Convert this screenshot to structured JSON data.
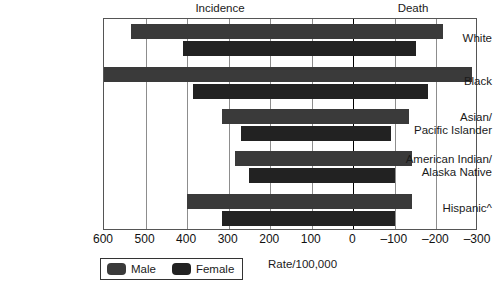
{
  "header": {
    "incidence_label": "Incidence",
    "death_label": "Death"
  },
  "axis": {
    "title": "Rate/100,000",
    "ticks": [
      "600",
      "500",
      "400",
      "300",
      "200",
      "100",
      "0",
      "–100",
      "–200",
      "–300"
    ],
    "tick_values": [
      600,
      500,
      400,
      300,
      200,
      100,
      0,
      -100,
      -200,
      -300
    ]
  },
  "legend": {
    "male_label": "Male",
    "female_label": "Female",
    "male_color": "#3a3a3a",
    "female_color": "#222222"
  },
  "categories": [
    "White",
    "Black",
    "Asian/\nPacific Islander",
    "American Indian/\nAlaska Native",
    "Hispanic^"
  ],
  "chart_data": {
    "type": "bar",
    "title": "",
    "subtitle": "",
    "orientation": "horizontal",
    "xlabel": "Rate/100,000",
    "ylabel": "",
    "xlim": [
      600,
      -300
    ],
    "x_axis_reversed": true,
    "grid": true,
    "gridlines": [
      600,
      500,
      400,
      300,
      200,
      100,
      0,
      -100,
      -200,
      -300
    ],
    "zero_line": 0,
    "legend_position": "bottom-left",
    "categories": [
      "White",
      "Black",
      "Asian/Pacific Islander",
      "American Indian/Alaska Native",
      "Hispanic^"
    ],
    "series": [
      {
        "name": "Male",
        "color": "#3a3a3a",
        "incidence": [
          535,
          600,
          315,
          285,
          400
        ],
        "death": [
          -215,
          -285,
          -135,
          -140,
          -140
        ]
      },
      {
        "name": "Female",
        "color": "#222222",
        "incidence": [
          410,
          385,
          270,
          250,
          315
        ],
        "death": [
          -150,
          -180,
          -90,
          -100,
          -100
        ]
      }
    ]
  }
}
